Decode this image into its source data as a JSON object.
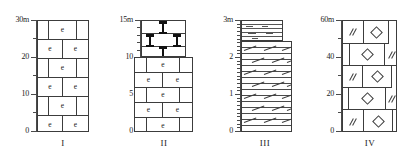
{
  "figure": {
    "type": "stratigraphic-columns",
    "count": 4,
    "unit": "m"
  },
  "columns": [
    {
      "id": "I",
      "roman_label": "I",
      "axis": {
        "top_label": "30m",
        "tick_labels": [
          "30m",
          "20",
          "10",
          "0"
        ],
        "tick_values": [
          30,
          20,
          10,
          0
        ],
        "minor_step": 5,
        "max": 30,
        "min": 0
      },
      "lithology": [
        {
          "pattern": "brick",
          "symbol": "e",
          "from": 0,
          "to": 30,
          "rows": 6
        }
      ]
    },
    {
      "id": "II",
      "roman_label": "II",
      "axis": {
        "top_label": "15m",
        "tick_labels": [
          "15m",
          "10",
          "5",
          "0"
        ],
        "tick_values": [
          15,
          10,
          5,
          0
        ],
        "minor_step": 1,
        "max": 15,
        "min": 0
      },
      "lithology": [
        {
          "pattern": "brick",
          "symbol": "e",
          "from": 0,
          "to": 10,
          "rows": 5
        },
        {
          "pattern": "bowtie",
          "symbol": "bowtie-icon",
          "from": 10,
          "to": 15,
          "rows": 3
        }
      ]
    },
    {
      "id": "III",
      "roman_label": "III",
      "axis": {
        "top_label": "3m",
        "tick_labels": [
          "3m",
          "2",
          "1",
          "0"
        ],
        "tick_values": [
          3,
          2,
          1,
          0
        ],
        "minor_step": 0.1,
        "max": 3,
        "min": 0
      },
      "lithology": [
        {
          "pattern": "laminated-limestone",
          "symbol": "oblique-dash",
          "from": 0,
          "to": 2.45
        },
        {
          "pattern": "shale",
          "symbol": "horizontal-dash",
          "from": 2.45,
          "to": 3.0
        }
      ]
    },
    {
      "id": "IV",
      "roman_label": "IV",
      "axis": {
        "top_label": "60m",
        "tick_labels": [
          "60m",
          "40",
          "20",
          "0"
        ],
        "tick_values": [
          60,
          40,
          20,
          0
        ],
        "minor_step": 10,
        "max": 60,
        "min": 0
      },
      "lithology": [
        {
          "pattern": "brick",
          "symbol": "diamond-and-double-slash",
          "from": 0,
          "to": 60,
          "rows": 5
        }
      ]
    }
  ],
  "colors": {
    "stroke": "#3c3c3c",
    "axis": "#4a4a4a",
    "fill": "#ffffff",
    "ink": "#111111"
  }
}
